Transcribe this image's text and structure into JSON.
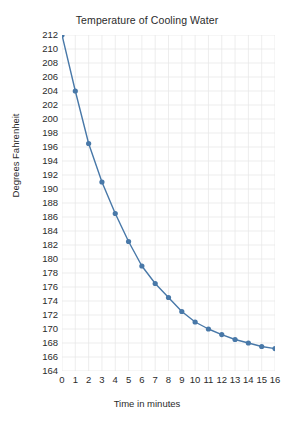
{
  "chart_data": {
    "type": "line",
    "title": "Temperature of Cooling Water",
    "xlabel": "Time in minutes",
    "ylabel": "Degrees Fahrenheit",
    "x": [
      0,
      1,
      2,
      3,
      4,
      5,
      6,
      7,
      8,
      9,
      10,
      11,
      12,
      13,
      14,
      15,
      16
    ],
    "values": [
      212,
      204,
      196.5,
      191,
      186.5,
      182.5,
      179,
      176.5,
      174.5,
      172.5,
      171,
      170,
      169.2,
      168.5,
      168,
      167.5,
      167.2
    ],
    "xlim": [
      0,
      16
    ],
    "ylim": [
      164,
      212
    ],
    "xticks": [
      "0",
      "1",
      "2",
      "3",
      "4",
      "5",
      "6",
      "7",
      "8",
      "9",
      "10",
      "11",
      "12",
      "13",
      "14",
      "15",
      "16"
    ],
    "yticks": [
      "212",
      "210",
      "208",
      "206",
      "204",
      "202",
      "200",
      "198",
      "196",
      "194",
      "192",
      "190",
      "188",
      "186",
      "184",
      "182",
      "180",
      "178",
      "176",
      "174",
      "172",
      "170",
      "168",
      "166",
      "164"
    ],
    "grid": true,
    "legend": false,
    "series_color": "#4878a8",
    "grid_color": "#e8e8e8",
    "background": "#ffffff"
  }
}
